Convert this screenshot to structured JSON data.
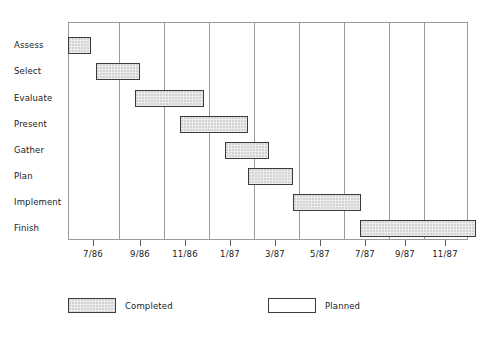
{
  "chart_data": {
    "type": "bar",
    "chart_subtype": "gantt",
    "title": "",
    "xlabel": "",
    "ylabel": "",
    "grid": true,
    "legend_position": "bottom",
    "x_axis": {
      "tick_labels": [
        "7/86",
        "9/86",
        "11/86",
        "1/87",
        "3/87",
        "5/87",
        "7/87",
        "9/87",
        "11/87"
      ],
      "tick_positions_px": [
        93,
        140,
        185,
        230,
        275,
        320,
        365,
        405,
        445
      ],
      "gridline_positions_px": [
        68,
        118,
        163,
        208,
        253,
        298,
        343,
        388,
        423,
        468
      ]
    },
    "categories": [
      "Assess",
      "Select",
      "Evaluate",
      "Present",
      "Gather",
      "Plan",
      "Implement",
      "Finish"
    ],
    "series": [
      {
        "name": "Completed",
        "fill": "stippled",
        "color": "#ececec",
        "border": "#3b3b3b"
      },
      {
        "name": "Planned",
        "fill": "empty",
        "color": "#ffffff",
        "border": "#3b3b3b"
      }
    ],
    "bars": [
      {
        "task": "Assess",
        "start_label": "7/86",
        "end_label": "8/86",
        "start_px": 0,
        "width_px": 23,
        "row": 0,
        "status": "Completed"
      },
      {
        "task": "Select",
        "start_label": "8/86",
        "end_label": "10/86",
        "start_px": 28,
        "width_px": 44,
        "row": 1,
        "status": "Completed"
      },
      {
        "task": "Evaluate",
        "start_label": "10/86",
        "end_label": "1/87",
        "start_px": 67,
        "width_px": 69,
        "row": 2,
        "status": "Completed"
      },
      {
        "task": "Present",
        "start_label": "12/86",
        "end_label": "3/87",
        "start_px": 112,
        "width_px": 68,
        "row": 3,
        "status": "Completed"
      },
      {
        "task": "Gather",
        "start_label": "3/87",
        "end_label": "4/87",
        "start_px": 157,
        "width_px": 44,
        "row": 4,
        "status": "Completed"
      },
      {
        "task": "Plan",
        "start_label": "4/87",
        "end_label": "6/87",
        "start_px": 180,
        "width_px": 45,
        "row": 5,
        "status": "Completed"
      },
      {
        "task": "Implement",
        "start_label": "5/87",
        "end_label": "8/87",
        "start_px": 225,
        "width_px": 68,
        "row": 6,
        "status": "Completed"
      },
      {
        "task": "Finish",
        "start_label": "7/87",
        "end_label": "12/87",
        "start_px": 292,
        "width_px": 116,
        "row": 7,
        "status": "Completed"
      }
    ],
    "row_centers_px": [
      23,
      49,
      76,
      102,
      128,
      154,
      180,
      206
    ],
    "bar_height_px": 17
  },
  "legend": {
    "items": [
      {
        "label": "Completed",
        "style": "completed",
        "left_px": 0
      },
      {
        "label": "Planned",
        "style": "planned",
        "left_px": 200
      }
    ]
  },
  "caption": {
    "text": ""
  },
  "colors": {
    "bar_fill": "#ececec",
    "bar_border": "#3b3b3b",
    "gridline": "#9a9a9a",
    "text": "#1a1a1a",
    "background": "#ffffff"
  }
}
